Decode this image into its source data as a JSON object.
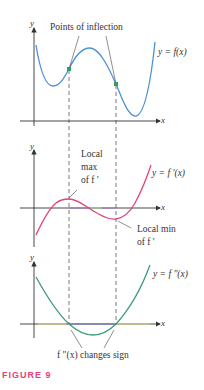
{
  "figure": {
    "caption": "FIGURE 9",
    "caption_color": "#e8407a"
  },
  "graph_top": {
    "y_axis_label": "y",
    "x_axis_label": "x",
    "curve_label": "y = f(x)",
    "annotation": "Points of inflection",
    "curve_color": "#4a90d9",
    "point_color": "#3a9a5a"
  },
  "graph_middle": {
    "y_axis_label": "y",
    "x_axis_label": "x",
    "curve_label": "y = f ′(x)",
    "annotation_max_line1": "Local",
    "annotation_max_line2": "max",
    "annotation_max_line3": "of f ′",
    "annotation_min_line1": "Local min",
    "annotation_min_line2": "of f ′",
    "curve_color": "#e0457f"
  },
  "graph_bottom": {
    "y_axis_label": "y",
    "x_axis_label": "x",
    "curve_label": "y = f ″(x)",
    "annotation": "f ″(x) changes sign",
    "curve_color": "#3f9a7a"
  }
}
